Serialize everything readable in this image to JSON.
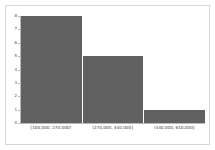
{
  "chart_data": {
    "type": "bar",
    "title": "",
    "subtitle": "",
    "xlabel": "",
    "ylabel": "",
    "categories": [
      "[100,000, 270,000)",
      "(270,000, 440,000]",
      "(440,000, 610,000]"
    ],
    "values": [
      8,
      5,
      1
    ],
    "series": [
      {
        "name": "count",
        "values": [
          8,
          5,
          1
        ]
      }
    ],
    "ylim": [
      0,
      8
    ],
    "yticks": [
      0,
      1,
      2,
      3,
      4,
      5,
      6,
      7,
      8
    ],
    "ytick_labels": [
      "0",
      "1",
      "2",
      "3",
      "4",
      "5",
      "6",
      "7",
      "8"
    ],
    "grid": false,
    "legend": false,
    "legend_position": "none",
    "bar_color": "#616161",
    "axis_color": "#b9b9b9",
    "frame_color": "#d8d8d8",
    "background_color": "#ffffff"
  }
}
